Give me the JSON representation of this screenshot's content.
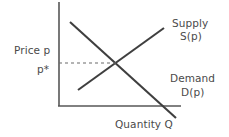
{
  "figure": {
    "kind": "supply-demand-diagram",
    "background_color": "#ffffff",
    "line_color": "#4a4a4a",
    "axis_color": "#575757",
    "text_color": "#4a4a4a"
  },
  "axes": {
    "y_axis_label": "Price p",
    "x_axis_label": "Quantity Q",
    "equilibrium_price_label": "p*",
    "y_axis": {
      "x": 59,
      "y_top": 2,
      "y_bottom": 106
    },
    "x_axis": {
      "y": 106,
      "x_left": 59,
      "x_right": 181
    },
    "grid": false
  },
  "curves": {
    "supply": {
      "name_label": "Supply",
      "function_label": "S(p)",
      "from": {
        "x": 78,
        "y": 90
      },
      "to": {
        "x": 164,
        "y": 28
      },
      "slope": "upward"
    },
    "demand": {
      "name_label": "Demand",
      "function_label": "D(p)",
      "from": {
        "x": 70,
        "y": 22
      },
      "to": {
        "x": 176,
        "y": 118
      },
      "slope": "downward"
    }
  },
  "equilibrium": {
    "point": {
      "x": 116,
      "y": 63
    },
    "dashed_guide": {
      "from_x": 59,
      "to_x": 116,
      "y": 63
    },
    "dash_pattern": "3,3"
  },
  "chart_data": {
    "type": "line",
    "title": "",
    "xlabel": "Quantity Q",
    "ylabel": "Price p",
    "grid": false,
    "legend_position": "inline-right",
    "annotations": [
      "p*"
    ],
    "series": [
      {
        "name": "Supply S(p)",
        "points": [
          [
            0.18,
            0.15
          ],
          [
            1.0,
            0.75
          ]
        ],
        "trend": "increasing"
      },
      {
        "name": "Demand D(p)",
        "points": [
          [
            0.1,
            1.0
          ],
          [
            1.08,
            0.0
          ]
        ],
        "trend": "decreasing"
      }
    ],
    "equilibrium": {
      "quantity": 0.47,
      "price": 0.41,
      "price_label": "p*"
    },
    "xlim": [
      0,
      1.15
    ],
    "ylim": [
      0,
      1.05
    ]
  }
}
